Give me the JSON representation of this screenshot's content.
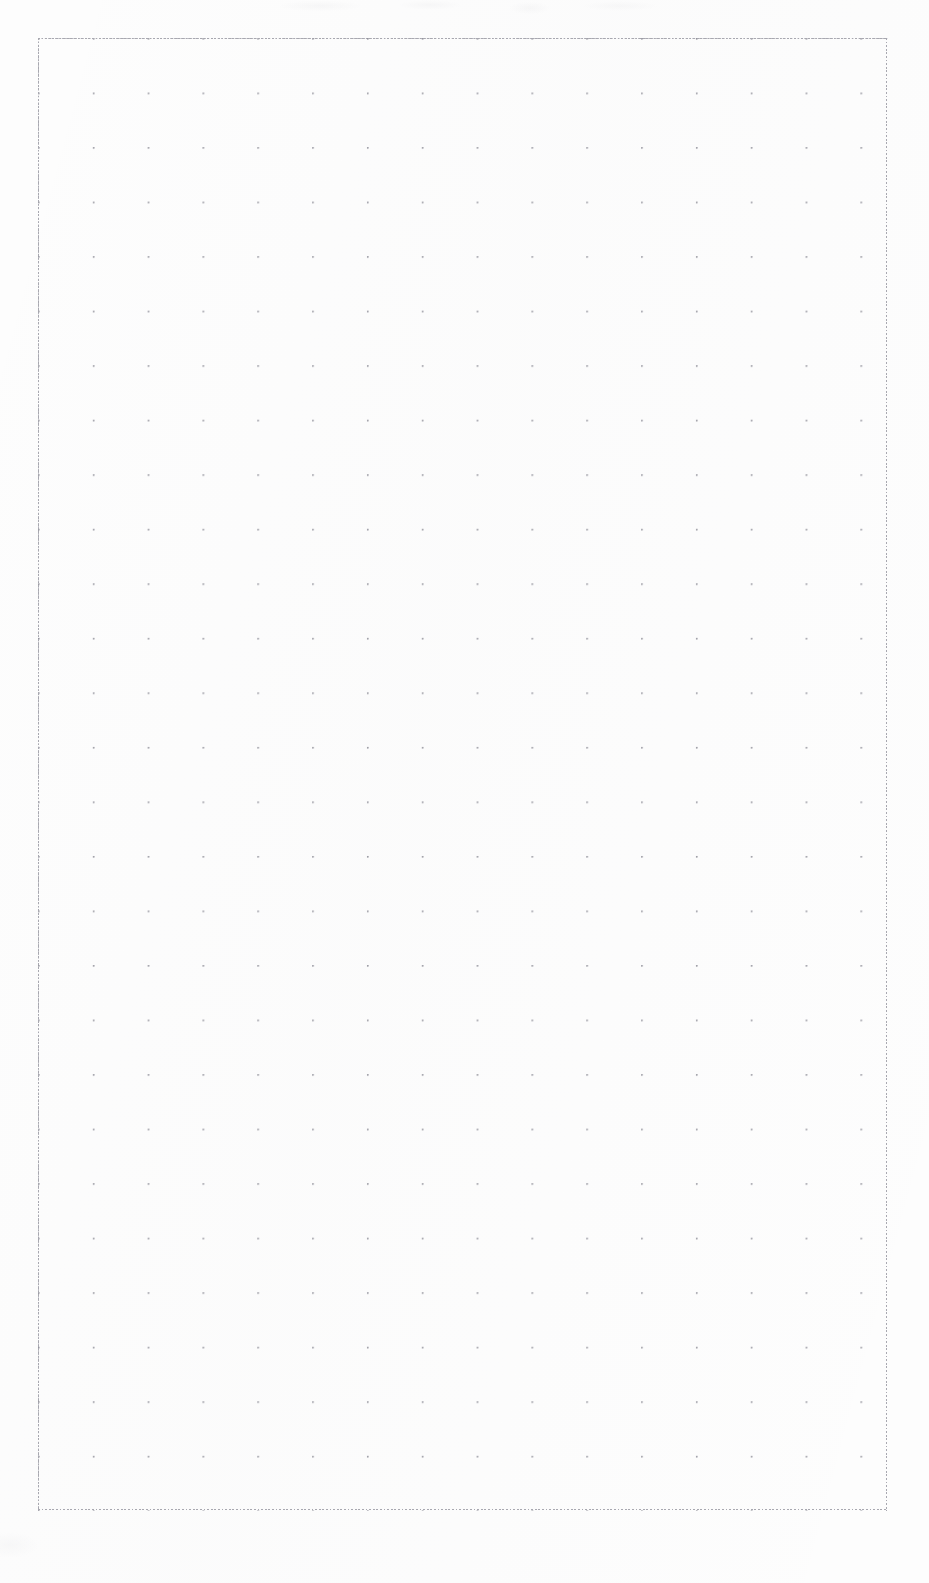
{
  "document": {
    "kind": "scanned-grid-paper",
    "title": "Blank grid paper sheet",
    "text_content": "",
    "notes": "No text, labels, handwriting, or markings are present on the sheet."
  },
  "page": {
    "width_px": 929,
    "height_px": 1583,
    "background_color": "#fdfdfd",
    "orientation": "portrait"
  },
  "grid": {
    "origin_x_px": 38,
    "origin_y_px": 38,
    "width_px": 850,
    "height_px": 1473,
    "columns": 31,
    "rows": 54,
    "cell_width_px": 27.42,
    "cell_height_px": 27.27,
    "line_style": "dotted",
    "minor_line_color": "#b4b4bb",
    "intersection_dot_color": "#8e8e98",
    "intersection_emphasis_every": 2,
    "border_color": "#a8a8b0"
  },
  "margins": {
    "left_px": 38,
    "top_px": 38,
    "right_px": 41,
    "bottom_px": 72,
    "content": ""
  },
  "artifacts": {
    "top_band_label": "faint scanner noise",
    "bottom_left_label": "faint scanner noise"
  }
}
